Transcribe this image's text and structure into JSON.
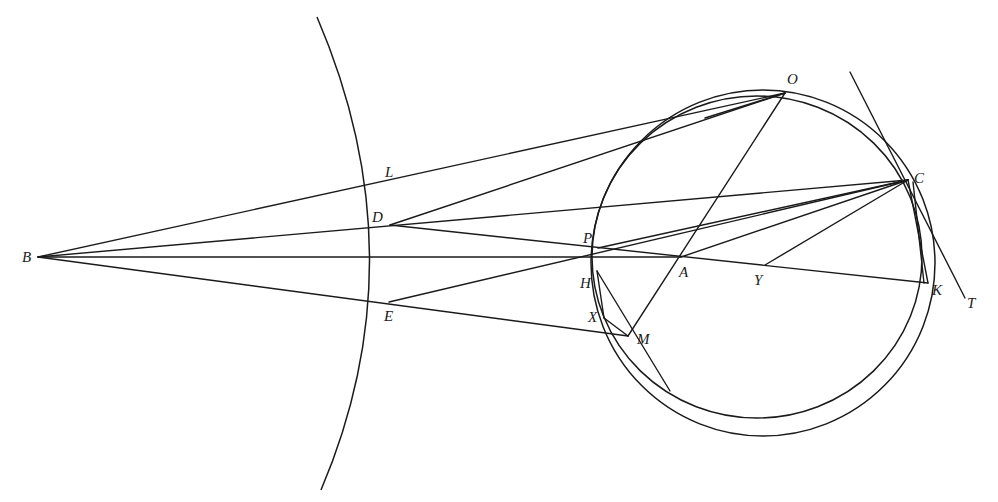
{
  "figure": {
    "type": "geometric-construction",
    "stroke_color": "#1a1a1a",
    "background": "#ffffff",
    "points": {
      "B": {
        "label": "B",
        "x": 38,
        "y": 257
      },
      "L": {
        "label": "L",
        "x": 389,
        "y": 185
      },
      "D": {
        "label": "D",
        "x": 390,
        "y": 225
      },
      "E": {
        "label": "E",
        "x": 389,
        "y": 302
      },
      "O": {
        "label": "O",
        "x": 785,
        "y": 93
      },
      "C": {
        "label": "C",
        "x": 908,
        "y": 180
      },
      "P": {
        "label": "P",
        "x": 598,
        "y": 248
      },
      "H": {
        "label": "H",
        "x": 597,
        "y": 271
      },
      "X": {
        "label": "X",
        "x": 604,
        "y": 318
      },
      "M": {
        "label": "M",
        "x": 628,
        "y": 336
      },
      "A": {
        "label": "A",
        "x": 681,
        "y": 257
      },
      "Y": {
        "label": "Y",
        "x": 765,
        "y": 265
      },
      "K": {
        "label": "K",
        "x": 928,
        "y": 283
      },
      "T": {
        "label": "T",
        "x": 965,
        "y": 298
      }
    },
    "labels": [
      "B",
      "L",
      "D",
      "E",
      "O",
      "C",
      "P",
      "H",
      "X",
      "M",
      "A",
      "Y",
      "K",
      "T"
    ]
  }
}
